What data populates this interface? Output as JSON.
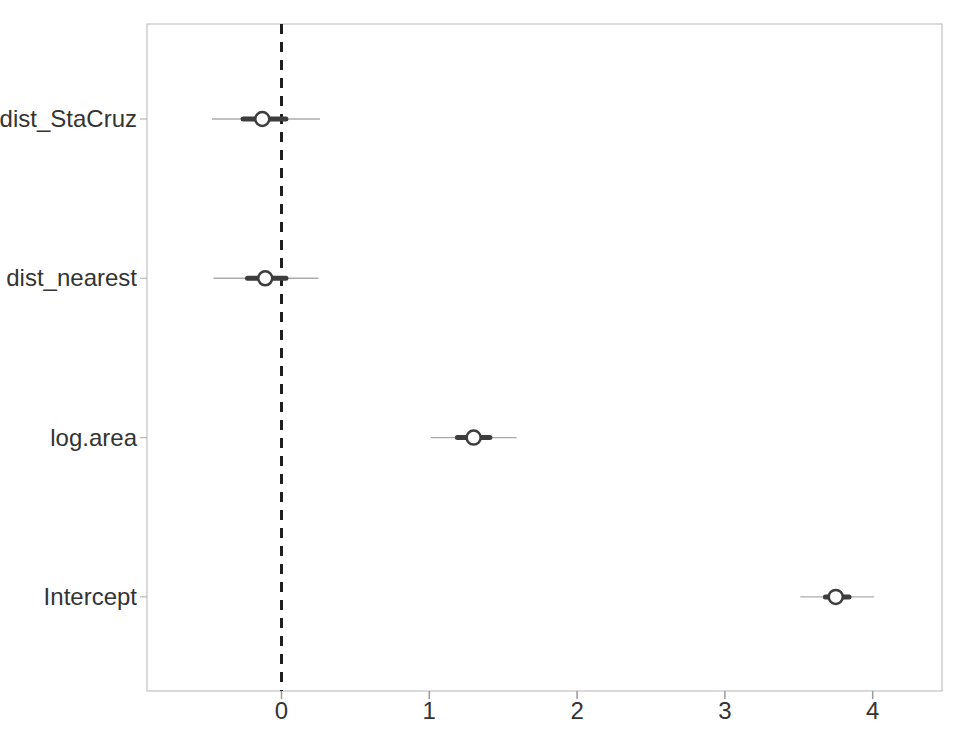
{
  "colors": {
    "background": "#ffffff",
    "frame": "#c2c2c2",
    "text": "#333333",
    "tick": "#9a9a9a",
    "left_tick": "#b8b8b8",
    "thin_ci": "#ababab",
    "thick_ci": "#3d3d3d",
    "point_fill": "#ffffff",
    "point_stroke": "#3d3d3d",
    "reference_line": "#1f1f1f"
  },
  "chart_data": {
    "type": "scatter",
    "subtype": "coefficient-dot-whisker",
    "orientation": "horizontal",
    "title": "",
    "xlabel": "",
    "ylabel": "",
    "grid": false,
    "legend": false,
    "xlim": [
      -0.91,
      4.47
    ],
    "x_ticks": [
      "0",
      "1",
      "2",
      "3",
      "4"
    ],
    "x_tick_values": [
      0,
      1,
      2,
      3,
      4
    ],
    "categories": [
      "dist_StaCruz",
      "dist_nearest",
      "log.area",
      "Intercept"
    ],
    "reference_line": {
      "x": 0,
      "style": "dashed"
    },
    "points": [
      {
        "label": "dist_StaCruz",
        "estimate": -0.13,
        "inner_ci": [
          -0.26,
          0.03
        ],
        "outer_ci": [
          -0.47,
          0.26
        ]
      },
      {
        "label": "dist_nearest",
        "estimate": -0.11,
        "inner_ci": [
          -0.23,
          0.03
        ],
        "outer_ci": [
          -0.46,
          0.25
        ]
      },
      {
        "label": "log.area",
        "estimate": 1.3,
        "inner_ci": [
          1.19,
          1.41
        ],
        "outer_ci": [
          1.01,
          1.59
        ]
      },
      {
        "label": "Intercept",
        "estimate": 3.75,
        "inner_ci": [
          3.68,
          3.84
        ],
        "outer_ci": [
          3.51,
          4.01
        ]
      }
    ]
  }
}
